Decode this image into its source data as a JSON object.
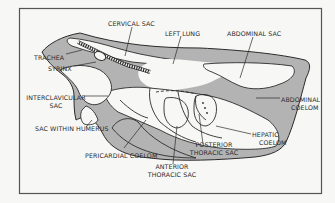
{
  "diagram": {
    "colors": {
      "background": "#f7f7f5",
      "frame": "#555555",
      "outline": "#2b2b2b",
      "coelom_fill": "#b3b3b3",
      "sac_fill": "#f7f7f5"
    },
    "labels": {
      "cervical_sac": "CERVICAL SAC",
      "left_lung": "LEFT LUNG",
      "abdominal_sac": "ABDOMINAL SAC",
      "trachea": "TRACHEA",
      "syrinx": "SYRINX",
      "interclavicular_1": "INTERCLAVICULAR",
      "interclavicular_2": "SAC",
      "abdominal_coelom_1": "ABDOMINAL",
      "abdominal_coelom_2": "COELOM",
      "sac_within_humerus": "SAC WITHIN HUMERUS",
      "hepatic_coelom_1": "HEPATIC",
      "hepatic_coelom_2": "COELOM",
      "posterior_thoracic_1": "POSTERIOR",
      "posterior_thoracic_2": "THORACIC SAC",
      "pericardial_coelom": "PERICARDIAL COELOM",
      "anterior_thoracic_1": "ANTERIOR",
      "anterior_thoracic_2": "THORACIC SAC"
    }
  }
}
